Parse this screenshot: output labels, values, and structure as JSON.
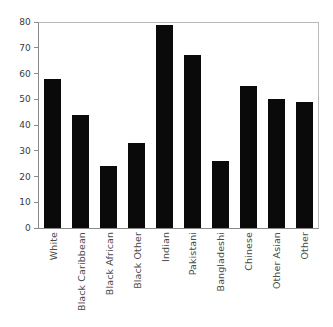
{
  "chart_data": {
    "type": "bar",
    "title": "",
    "subtitle": "",
    "xlabel": "",
    "ylabel": "",
    "categories": [
      "White",
      "Black Caribbean",
      "Black African",
      "Black Other",
      "Indian",
      "Pakistani",
      "Bangladeshi",
      "Chinese",
      "Other Asian",
      "Other"
    ],
    "values": [
      58,
      44,
      24,
      33,
      79,
      67,
      26,
      55,
      50,
      49
    ],
    "ylim": [
      0,
      80
    ],
    "ytick_labels": [
      "80",
      "70",
      "60",
      "50",
      "40",
      "30",
      "20",
      "10",
      "0"
    ],
    "ytick_values": [
      80,
      70,
      60,
      50,
      40,
      30,
      20,
      10,
      0
    ],
    "ytick_step": 10,
    "grid": false,
    "legend": null,
    "legend_position": "none",
    "annotations": [],
    "bar_color": "#0a0a0a",
    "axis_color": "#8a8a8a",
    "frame_color": "#b9b9b9",
    "label_color": "#4a4a4a",
    "background": "#ffffff",
    "xtick_label_rotation": 90
  }
}
